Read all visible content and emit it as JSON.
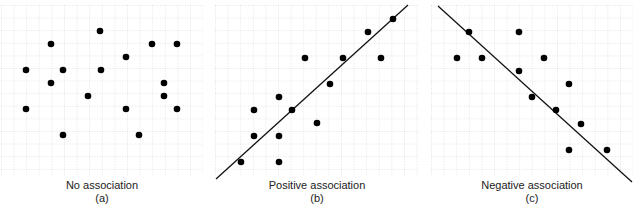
{
  "chart_data": [
    {
      "type": "scatter",
      "title": "No association",
      "label": "(a)",
      "grid": true,
      "trendline": null,
      "points": [
        [
          100,
          31
        ],
        [
          51,
          44
        ],
        [
          152,
          44
        ],
        [
          177,
          44
        ],
        [
          126,
          57
        ],
        [
          26,
          70
        ],
        [
          63,
          70
        ],
        [
          101,
          70
        ],
        [
          51,
          83
        ],
        [
          164,
          83
        ],
        [
          88,
          96
        ],
        [
          164,
          96
        ],
        [
          26,
          109
        ],
        [
          126,
          109
        ],
        [
          177,
          109
        ],
        [
          63,
          135
        ],
        [
          139,
          135
        ]
      ]
    },
    {
      "type": "scatter",
      "title": "Positive association",
      "label": "(b)",
      "grid": true,
      "trendline": {
        "x1": 216,
        "y1": 179,
        "x2": 408,
        "y2": 5
      },
      "points": [
        [
          241,
          162
        ],
        [
          279,
          162
        ],
        [
          254,
          136
        ],
        [
          279,
          136
        ],
        [
          254,
          110
        ],
        [
          279,
          97
        ],
        [
          292,
          110
        ],
        [
          317,
          123
        ],
        [
          330,
          84
        ],
        [
          305,
          58
        ],
        [
          343,
          58
        ],
        [
          381,
          58
        ],
        [
          368,
          32
        ],
        [
          393,
          19
        ]
      ]
    },
    {
      "type": "scatter",
      "title": "Negative association",
      "label": "(c)",
      "grid": true,
      "trendline": {
        "x1": 438,
        "y1": 6,
        "x2": 632,
        "y2": 182
      },
      "points": [
        [
          469,
          32
        ],
        [
          519,
          32
        ],
        [
          457,
          58
        ],
        [
          482,
          58
        ],
        [
          544,
          58
        ],
        [
          519,
          71
        ],
        [
          569,
          84
        ],
        [
          532,
          97
        ],
        [
          556,
          110
        ],
        [
          581,
          124
        ],
        [
          569,
          150
        ],
        [
          607,
          150
        ]
      ]
    }
  ],
  "panels": [
    {
      "title": "No association",
      "letter": "(a)"
    },
    {
      "title": "Positive association",
      "letter": "(b)"
    },
    {
      "title": "Negative association",
      "letter": "(c)"
    }
  ],
  "colors": {
    "grid": "#b8b8b8",
    "point": "#000000",
    "line": "#111111",
    "text": "#222222"
  }
}
